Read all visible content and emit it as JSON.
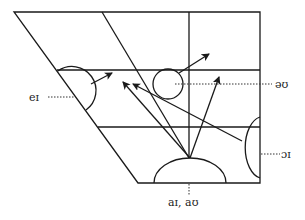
{
  "diagram": {
    "title": "",
    "type": "vowel quadrilateral with diphthong trajectories",
    "line_color": "#1a1a1a",
    "labels": {
      "ei": "eɪ",
      "au_schwa": "əʊ",
      "oi": "ɔɪ",
      "ai_au": "aɪ,  aʊ"
    },
    "trajectories": [
      {
        "name": "eɪ",
        "from": "front half-close/mid",
        "to": "front near-close"
      },
      {
        "name": "əʊ",
        "from": "central mid",
        "to": "back near-close"
      },
      {
        "name": "ɔɪ",
        "from": "back open-mid",
        "to": "front near-close"
      },
      {
        "name": "aɪ",
        "from": "open central",
        "to": "front near-close"
      },
      {
        "name": "aʊ",
        "from": "open central",
        "to": "back near-close"
      }
    ]
  }
}
